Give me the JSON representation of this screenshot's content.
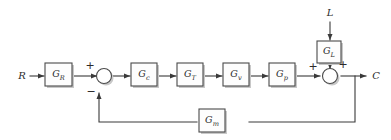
{
  "diagram": {
    "type": "control-block-diagram",
    "signals": {
      "reference_input": "R",
      "load_disturbance": "L",
      "controlled_output": "C"
    },
    "blocks": [
      {
        "id": "gr",
        "base": "G",
        "sub": "R",
        "label": "G_R",
        "role": "reference-scaling"
      },
      {
        "id": "gc",
        "base": "G",
        "sub": "c",
        "label": "G_c",
        "role": "controller"
      },
      {
        "id": "gt",
        "base": "G",
        "sub": "T",
        "label": "G_T",
        "role": "transmitter"
      },
      {
        "id": "gv",
        "base": "G",
        "sub": "v",
        "label": "G_v",
        "role": "valve"
      },
      {
        "id": "gp",
        "base": "G",
        "sub": "p",
        "label": "G_p",
        "role": "process"
      },
      {
        "id": "gl",
        "base": "G",
        "sub": "L",
        "label": "G_L",
        "role": "load-disturbance"
      },
      {
        "id": "gm",
        "base": "G",
        "sub": "m",
        "label": "G_m",
        "role": "measurement-feedback"
      }
    ],
    "summers": [
      {
        "id": "error-summer",
        "inputs": [
          {
            "from": "G_R",
            "sign": "+",
            "position": "left"
          },
          {
            "from": "G_m",
            "sign": "-",
            "position": "bottom"
          }
        ]
      },
      {
        "id": "output-summer",
        "inputs": [
          {
            "from": "G_p",
            "sign": "+",
            "position": "left"
          },
          {
            "from": "G_L",
            "sign": "+",
            "position": "top"
          }
        ]
      }
    ],
    "signs": {
      "plus": "+",
      "minus": "−"
    },
    "colors": {
      "line": "#3a3a3a",
      "block_stroke": "#4a4a4a",
      "block_fill": "#fdfdfd",
      "shadow": "#c8c8c8",
      "text": "#2b2b2b",
      "background": "#ffffff"
    }
  }
}
